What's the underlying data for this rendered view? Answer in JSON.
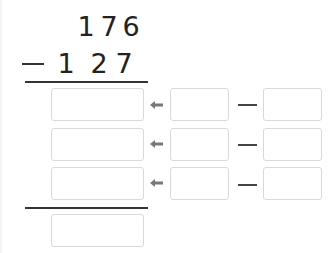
{
  "problem": {
    "minuend": [
      "1",
      "7",
      "6"
    ],
    "operator": "−",
    "subtrahend": [
      "1",
      "2",
      "7"
    ]
  },
  "steps": [
    {
      "result": "",
      "left": "",
      "operator": "—",
      "right": ""
    },
    {
      "result": "",
      "left": "",
      "operator": "—",
      "right": ""
    },
    {
      "result": "",
      "left": "",
      "operator": "—",
      "right": ""
    }
  ],
  "final_answer": "",
  "colors": {
    "line": "#333333",
    "box_border": "#d9d9d9",
    "arrow": "#777777"
  }
}
